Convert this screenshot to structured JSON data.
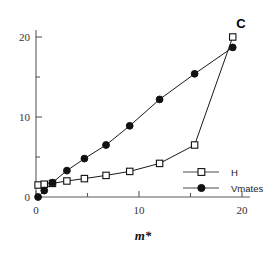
{
  "panel": {
    "label": "C"
  },
  "axes": {
    "x_title": "m*",
    "x_ticks_major": [
      "0",
      "10",
      "20"
    ],
    "y_ticks_major": [
      "0",
      "10",
      "20"
    ]
  },
  "legend": {
    "entries": [
      {
        "label": "H",
        "marker": "open-square"
      },
      {
        "label": "Vmates",
        "marker": "filled-circle"
      }
    ]
  },
  "chart_data": {
    "type": "line",
    "title": "",
    "xlabel": "m*",
    "ylabel": "",
    "xlim": [
      0,
      21
    ],
    "ylim": [
      0,
      21
    ],
    "grid": false,
    "legend_position": "inside-bottom-right",
    "x_ticks_major": [
      0,
      10,
      20
    ],
    "x_ticks_minor": [
      5,
      15
    ],
    "y_ticks_major": [
      0,
      10,
      20
    ],
    "y_ticks_minor": [
      5,
      15
    ],
    "series": [
      {
        "name": "H",
        "marker": "open-square",
        "x": [
          0.2,
          0.8,
          1.6,
          3.0,
          4.7,
          6.8,
          9.1,
          12.0,
          15.4,
          19.1
        ],
        "y": [
          1.5,
          1.6,
          1.7,
          2.0,
          2.3,
          2.7,
          3.2,
          4.2,
          6.5,
          20.0
        ]
      },
      {
        "name": "Vmates",
        "marker": "filled-circle",
        "x": [
          0.2,
          0.8,
          1.6,
          3.0,
          4.7,
          6.8,
          9.1,
          12.0,
          15.4,
          19.1
        ],
        "y": [
          0.0,
          0.8,
          1.8,
          3.3,
          4.8,
          6.5,
          8.9,
          12.2,
          15.4,
          18.7
        ]
      }
    ]
  }
}
